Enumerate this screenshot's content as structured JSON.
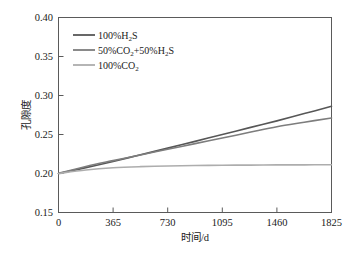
{
  "chart_data": {
    "type": "line",
    "title": "",
    "xlabel": "时间/d",
    "ylabel": "孔隙度",
    "xlim": [
      0,
      1825
    ],
    "ylim": [
      0.15,
      0.4
    ],
    "xticks": [
      "0",
      "365",
      "730",
      "1095",
      "1460",
      "1825"
    ],
    "xtick_values": [
      0,
      365,
      730,
      1095,
      1460,
      1825
    ],
    "yticks": [
      "0.15",
      "0.20",
      "0.25",
      "0.30",
      "0.35",
      "0.40"
    ],
    "ytick_values": [
      0.15,
      0.2,
      0.25,
      0.3,
      0.35,
      0.4
    ],
    "grid": false,
    "legend_position": "upper-left",
    "x": [
      0,
      183,
      365,
      548,
      730,
      913,
      1095,
      1278,
      1460,
      1643,
      1825
    ],
    "series": [
      {
        "name": "100%H2S",
        "label_main": "100%H",
        "label_sub": "2",
        "label_tail": "S",
        "color": "#575757",
        "values": [
          0.2,
          0.2075,
          0.2155,
          0.224,
          0.2325,
          0.2412,
          0.25,
          0.2588,
          0.2675,
          0.2768,
          0.2862
        ]
      },
      {
        "name": "50%CO2+50%H2S",
        "label_main": "50%CO",
        "label_sub": "2",
        "label_mid": "+50%H",
        "label_sub2": "2",
        "label_tail": "S",
        "color": "#7d7d7d",
        "values": [
          0.2,
          0.209,
          0.2165,
          0.2238,
          0.231,
          0.2383,
          0.2455,
          0.2528,
          0.26,
          0.2657,
          0.2712
        ]
      },
      {
        "name": "100%CO2",
        "label_main": "100%CO",
        "label_sub": "2",
        "label_tail": "",
        "color": "#adadad",
        "values": [
          0.2,
          0.2045,
          0.2073,
          0.2088,
          0.2097,
          0.2102,
          0.2106,
          0.2108,
          0.211,
          0.2111,
          0.2112
        ]
      }
    ]
  },
  "legend": {
    "entries": [
      {
        "text": "100%H₂S"
      },
      {
        "text": "50%CO₂+50%H₂S"
      },
      {
        "text": "100%CO₂"
      }
    ]
  },
  "axes": {
    "x_title": "时间/d",
    "y_title": "孔隙度"
  }
}
